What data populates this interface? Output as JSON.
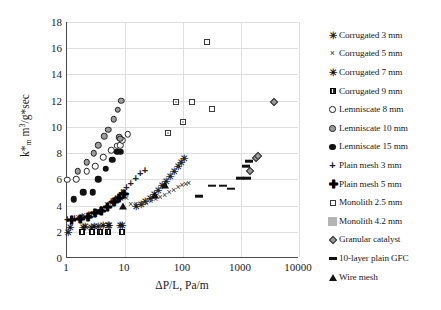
{
  "chart_data": {
    "type": "scatter",
    "title": "",
    "xlabel": "ΔP/L, Pa/m",
    "ylabel": "k*m m³/g*sec",
    "xscale": "log",
    "xlim": [
      1,
      10000
    ],
    "ylim": [
      0,
      18
    ],
    "ytick_step": 2,
    "grid": true,
    "legend_position": "right",
    "xticks": [
      "1",
      "10",
      "100",
      "1000",
      "10000"
    ],
    "yticks": [
      "0",
      "2",
      "4",
      "6",
      "8",
      "10",
      "12",
      "14",
      "16",
      "18"
    ],
    "series": [
      {
        "name": "Corrugated 3 mm",
        "marker": "asterisk",
        "points": [
          [
            1.05,
            2.0
          ],
          [
            1.9,
            2.35
          ],
          [
            2.6,
            2.4
          ],
          [
            3.5,
            2.45
          ],
          [
            5.2,
            2.5
          ],
          [
            8.5,
            2.55
          ],
          [
            16,
            3.95
          ],
          [
            19,
            4.15
          ],
          [
            23,
            4.35
          ],
          [
            27,
            4.6
          ],
          [
            32,
            4.9
          ],
          [
            38,
            5.2
          ],
          [
            45,
            5.55
          ],
          [
            52,
            5.9
          ],
          [
            60,
            6.25
          ],
          [
            70,
            6.6
          ],
          [
            82,
            7.0
          ],
          [
            95,
            7.35
          ],
          [
            108,
            7.6
          ]
        ]
      },
      {
        "name": "Corrugated 5 mm",
        "marker": "x",
        "points": [
          [
            1.6,
            3.1
          ],
          [
            2.0,
            3.3
          ],
          [
            2.6,
            3.45
          ],
          [
            3.3,
            3.6
          ],
          [
            4.2,
            3.85
          ],
          [
            5.0,
            4.1
          ],
          [
            6.2,
            4.2
          ],
          [
            7.5,
            4.35
          ],
          [
            9.0,
            4.5
          ],
          [
            11,
            4.6
          ],
          [
            13,
            4.1
          ],
          [
            16,
            4.1
          ],
          [
            20,
            4.1
          ],
          [
            24,
            4.2
          ],
          [
            29,
            4.35
          ],
          [
            35,
            4.5
          ],
          [
            42,
            4.65
          ],
          [
            50,
            4.8
          ],
          [
            60,
            5.0
          ],
          [
            72,
            5.2
          ],
          [
            86,
            5.4
          ],
          [
            100,
            5.55
          ],
          [
            115,
            5.65
          ],
          [
            130,
            5.7
          ]
        ]
      },
      {
        "name": "Corrugated 7 mm",
        "marker": "x-bold",
        "points": [
          [
            1.15,
            2.4
          ],
          [
            2.1,
            2.45
          ],
          [
            3.0,
            2.45
          ],
          [
            4.2,
            2.5
          ],
          [
            5.5,
            2.5
          ],
          [
            9.0,
            2.55
          ]
        ]
      },
      {
        "name": "Corrugated 9 mm",
        "marker": "square-filled",
        "points": [
          [
            1.9,
            2.0
          ],
          [
            2.8,
            2.0
          ],
          [
            3.9,
            2.0
          ],
          [
            5.4,
            2.0
          ],
          [
            9.2,
            2.0
          ]
        ]
      },
      {
        "name": "Lemniscate 8 mm",
        "marker": "circle-open",
        "points": [
          [
            1.05,
            5.95
          ],
          [
            1.5,
            6.0
          ],
          [
            2.3,
            6.6
          ],
          [
            3.2,
            7.0
          ],
          [
            4.4,
            7.7
          ],
          [
            6.0,
            8.2
          ],
          [
            7.6,
            8.55
          ],
          [
            8.6,
            8.6
          ],
          [
            9.4,
            9.0
          ],
          [
            11.5,
            9.45
          ]
        ]
      },
      {
        "name": "Lemniscate 10 mm",
        "marker": "circle-gray",
        "points": [
          [
            1.6,
            6.6
          ],
          [
            2.3,
            7.3
          ],
          [
            3.0,
            8.0
          ],
          [
            3.6,
            8.6
          ],
          [
            4.6,
            9.3
          ],
          [
            5.4,
            9.8
          ],
          [
            6.6,
            10.6
          ],
          [
            7.8,
            11.3
          ],
          [
            9.0,
            12.0
          ],
          [
            8.3,
            9.2
          ],
          [
            8.6,
            9.1
          ]
        ]
      },
      {
        "name": "Lemniscate 15 mm",
        "marker": "circle-filled",
        "points": [
          [
            1.35,
            4.5
          ],
          [
            2.0,
            5.0
          ],
          [
            2.9,
            5.0
          ],
          [
            3.6,
            6.0
          ],
          [
            4.8,
            6.8
          ],
          [
            6.3,
            7.5
          ],
          [
            7.6,
            8.1
          ],
          [
            8.8,
            8.1
          ]
        ]
      },
      {
        "name": "Plain mesh 3 mm",
        "marker": "plus",
        "points": [
          [
            1.05,
            3.0
          ],
          [
            1.4,
            3.05
          ],
          [
            1.9,
            3.15
          ],
          [
            2.5,
            3.3
          ],
          [
            3.2,
            3.5
          ],
          [
            4.0,
            3.7
          ],
          [
            5.0,
            4.0
          ],
          [
            6.0,
            4.35
          ],
          [
            7.2,
            4.6
          ],
          [
            9.0,
            5.0
          ],
          [
            11,
            5.4
          ],
          [
            13,
            5.7
          ],
          [
            16,
            6.1
          ],
          [
            19,
            6.5
          ],
          [
            23,
            6.7
          ]
        ]
      },
      {
        "name": "Plain mesh 5 mm",
        "marker": "plus-bold",
        "points": [
          [
            1.2,
            2.9
          ],
          [
            1.7,
            3.0
          ],
          [
            2.3,
            3.15
          ],
          [
            3.0,
            3.4
          ],
          [
            3.9,
            3.6
          ],
          [
            5.0,
            3.9
          ],
          [
            6.4,
            4.3
          ],
          [
            7.8,
            4.6
          ],
          [
            9.5,
            4.9
          ]
        ]
      },
      {
        "name": "Monolith 2.5 mm",
        "marker": "square-open",
        "points": [
          [
            150,
            11.9
          ],
          [
            270,
            16.5
          ],
          [
            330,
            11.4
          ]
        ]
      },
      {
        "name": "Monolith 4.2 mm",
        "marker": "square-gray",
        "points": [
          [
            58,
            9.5
          ],
          [
            105,
            10.4
          ],
          [
            78,
            11.9
          ]
        ]
      },
      {
        "name": "Granular catalyst",
        "marker": "diamond",
        "points": [
          [
            1500,
            6.6
          ],
          [
            1900,
            7.6
          ],
          [
            2050,
            7.8
          ],
          [
            3800,
            11.9
          ]
        ]
      },
      {
        "name": "10-layer plain GFC",
        "marker": "dash",
        "points": [
          [
            200,
            4.7
          ],
          [
            330,
            5.5
          ],
          [
            500,
            5.5
          ],
          [
            700,
            5.3
          ],
          [
            1000,
            6.1
          ],
          [
            1250,
            7.0
          ],
          [
            1450,
            7.4
          ],
          [
            1300,
            6.1
          ]
        ]
      },
      {
        "name": "Wire mesh",
        "marker": "triangle",
        "points": [
          [
            9.5,
            4.0
          ],
          [
            34,
            4.8
          ],
          [
            50,
            5.6
          ]
        ]
      }
    ]
  },
  "legend": {
    "items": [
      {
        "label": "Corrugated 3 mm",
        "marker": "asterisk"
      },
      {
        "label": "Corrugated 5 mm",
        "marker": "x"
      },
      {
        "label": "Corrugated 7 mm",
        "marker": "x-bold"
      },
      {
        "label": "Corrugated 9 mm",
        "marker": "square-filled"
      },
      {
        "label": "Lemniscate 8 mm",
        "marker": "circle-open"
      },
      {
        "label": "Lemniscate 10 mm",
        "marker": "circle-gray"
      },
      {
        "label": "Lemniscate 15 mm",
        "marker": "circle-filled"
      },
      {
        "label": "Plain mesh 3 mm",
        "marker": "plus"
      },
      {
        "label": "Plain mesh 5 mm",
        "marker": "plus-bold"
      },
      {
        "label": "Monolith 2.5 mm",
        "marker": "square-open"
      },
      {
        "label": "Monolith 4.2 mm",
        "marker": "square-gray"
      },
      {
        "label": "Granular catalyst",
        "marker": "diamond"
      },
      {
        "label": "10-layer plain GFC",
        "marker": "dash"
      },
      {
        "label": "Wire mesh",
        "marker": "triangle"
      }
    ]
  },
  "colors": {
    "axis": "#4a4a4a",
    "grid": "#dedede",
    "marker_dark": "#111111",
    "marker_gray": "#9d9d9d",
    "background": "#ffffff"
  }
}
